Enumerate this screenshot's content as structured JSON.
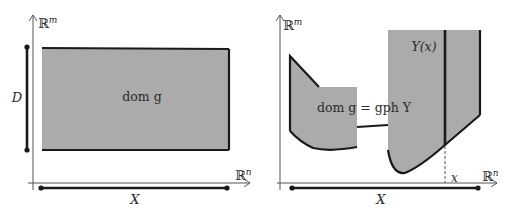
{
  "left_panel": {
    "y_axis_label": "ℝ",
    "y_axis_sup": "m",
    "x_axis_label": "ℝ",
    "x_axis_sup": "n",
    "region_label": "dom g",
    "vertical_bar_label": "D",
    "horizontal_bar_label": "X"
  },
  "right_panel": {
    "y_axis_label": "ℝ",
    "y_axis_sup": "m",
    "x_axis_label": "ℝ",
    "x_axis_sup": "n",
    "region_label": "dom g = gph Y",
    "fiber_label": "Y(x)",
    "point_label": "x",
    "horizontal_bar_label": "X"
  },
  "colors": {
    "fill": "#ababab",
    "stroke": "#1a1a1a",
    "axis": "#555555"
  }
}
